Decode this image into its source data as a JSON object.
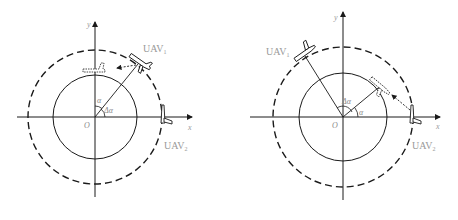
{
  "figure": {
    "left_panel": {
      "axis_x_label": "x",
      "axis_y_label": "y",
      "origin_label": "O",
      "angle_alpha_label": "α",
      "angle_delta_label": "Δα",
      "uav_top_label": "UAV",
      "uav_top_sub": "1",
      "uav_right_label": "UAV",
      "uav_right_sub": "2"
    },
    "right_panel": {
      "axis_x_label": "x",
      "axis_y_label": "y",
      "origin_label": "O",
      "angle_alpha_label": "α",
      "angle_delta_label": "Δα",
      "uav_top_label": "UAV",
      "uav_top_sub": "1",
      "uav_right_label": "UAV",
      "uav_right_sub": "2"
    },
    "colors": {
      "line": "#1a1a1a",
      "label": "#9a9a9a"
    }
  }
}
